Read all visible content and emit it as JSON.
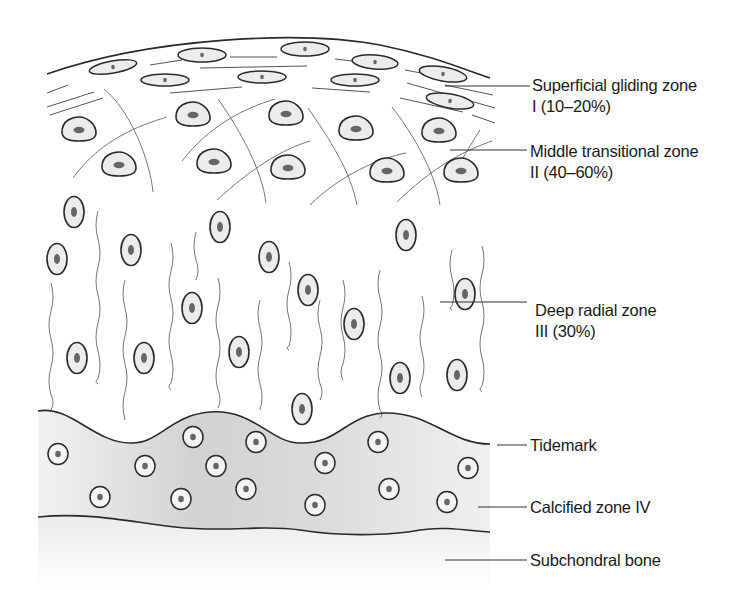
{
  "figure": {
    "labels": {
      "superficial": {
        "name": "Superficial gliding zone",
        "detail": "I (10–20%)"
      },
      "middle": {
        "name": "Middle transitional zone",
        "detail": "II (40–60%)"
      },
      "deep": {
        "name": "Deep radial zone",
        "detail": "III (30%)"
      },
      "tidemark": {
        "name": "Tidemark"
      },
      "calcified": {
        "name": "Calcified zone IV"
      },
      "bone": {
        "name": "Subchondral bone"
      }
    },
    "colors": {
      "line": "#2a2a2a",
      "fiber": "#6a6a6a",
      "cell_fill": "#ececec",
      "nucleus": "#666666",
      "calcified_fill": "#d4d4d4",
      "bone_fill": "#efefef"
    }
  }
}
